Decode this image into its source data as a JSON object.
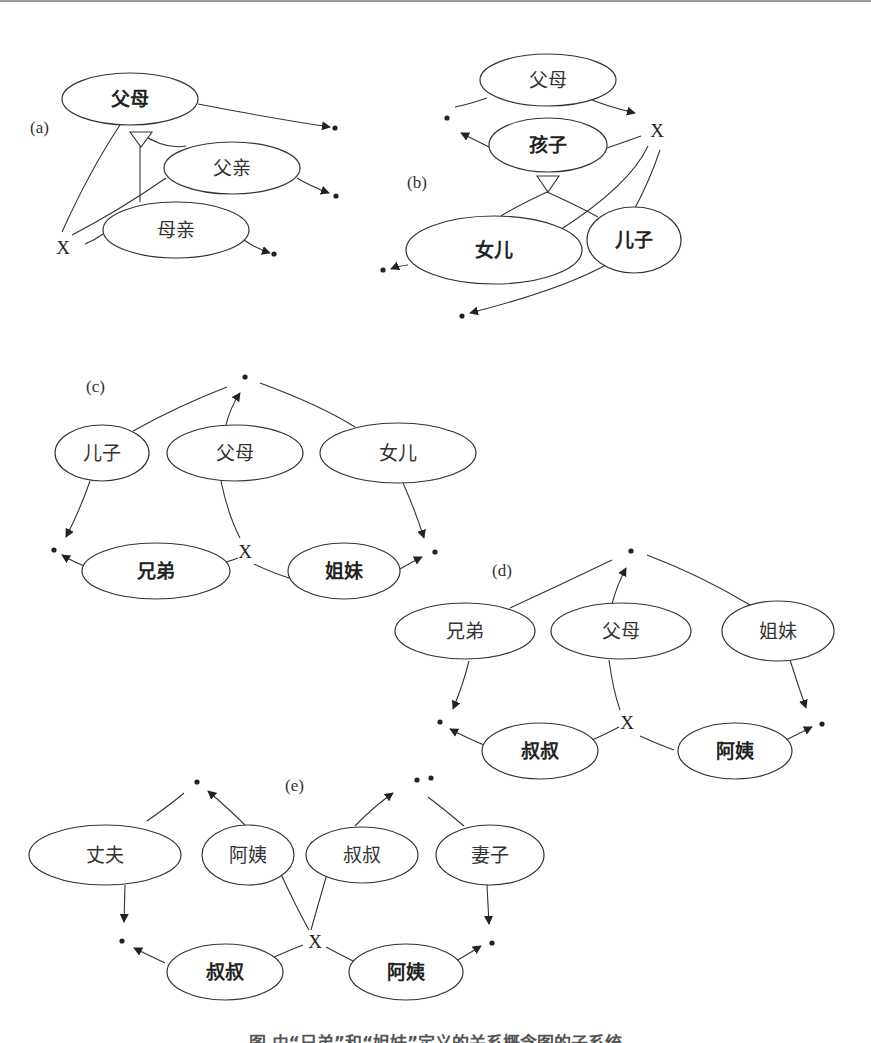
{
  "figure": {
    "caption": "图 由“兄弟”和“姐妹”定义的关系概念图的子系统",
    "colors": {
      "stroke": "#333333",
      "fill": "#ffffff",
      "text": "#333333"
    },
    "panels": [
      {
        "id": "a",
        "label": "(a)",
        "label_pos": [
          30,
          133
        ]
      },
      {
        "id": "b",
        "label": "(b)",
        "label_pos": [
          407,
          188
        ]
      },
      {
        "id": "c",
        "label": "(c)",
        "label_pos": [
          86,
          392
        ]
      },
      {
        "id": "d",
        "label": "(d)",
        "label_pos": [
          492,
          576
        ]
      },
      {
        "id": "e",
        "label": "(e)",
        "label_pos": [
          285,
          791
        ]
      }
    ],
    "nodes": [
      {
        "id": "a_parents",
        "label": "父母",
        "cx": 130,
        "cy": 99,
        "rx": 68,
        "ry": 26,
        "bold": true
      },
      {
        "id": "a_father",
        "label": "父亲",
        "cx": 232,
        "cy": 168,
        "rx": 68,
        "ry": 26,
        "bold": false
      },
      {
        "id": "a_mother",
        "label": "母亲",
        "cx": 176,
        "cy": 230,
        "rx": 73,
        "ry": 28,
        "bold": false
      },
      {
        "id": "b_parents",
        "label": "父母",
        "cx": 548,
        "cy": 80,
        "rx": 68,
        "ry": 26,
        "bold": false
      },
      {
        "id": "b_child",
        "label": "孩子",
        "cx": 548,
        "cy": 145,
        "rx": 59,
        "ry": 27,
        "bold": true
      },
      {
        "id": "b_daughter",
        "label": "女儿",
        "cx": 494,
        "cy": 250,
        "rx": 88,
        "ry": 34,
        "bold": true
      },
      {
        "id": "b_son",
        "label": "儿子",
        "cx": 634,
        "cy": 240,
        "rx": 47,
        "ry": 33,
        "bold": true
      },
      {
        "id": "c_son",
        "label": "儿子",
        "cx": 102,
        "cy": 453,
        "rx": 47,
        "ry": 28,
        "bold": false
      },
      {
        "id": "c_parents",
        "label": "父母",
        "cx": 235,
        "cy": 453,
        "rx": 68,
        "ry": 28,
        "bold": false
      },
      {
        "id": "c_daughter",
        "label": "女儿",
        "cx": 398,
        "cy": 453,
        "rx": 78,
        "ry": 30,
        "bold": false
      },
      {
        "id": "c_brother",
        "label": "兄弟",
        "cx": 156,
        "cy": 571,
        "rx": 74,
        "ry": 28,
        "bold": true
      },
      {
        "id": "c_sister",
        "label": "姐妹",
        "cx": 344,
        "cy": 571,
        "rx": 56,
        "ry": 28,
        "bold": true
      },
      {
        "id": "d_brother",
        "label": "兄弟",
        "cx": 465,
        "cy": 631,
        "rx": 70,
        "ry": 28,
        "bold": false
      },
      {
        "id": "d_parents",
        "label": "父母",
        "cx": 621,
        "cy": 631,
        "rx": 70,
        "ry": 28,
        "bold": false
      },
      {
        "id": "d_sister",
        "label": "姐妹",
        "cx": 778,
        "cy": 631,
        "rx": 56,
        "ry": 30,
        "bold": false
      },
      {
        "id": "d_uncle",
        "label": "叔叔",
        "cx": 540,
        "cy": 751,
        "rx": 58,
        "ry": 28,
        "bold": true
      },
      {
        "id": "d_aunt",
        "label": "阿姨",
        "cx": 735,
        "cy": 751,
        "rx": 57,
        "ry": 28,
        "bold": true
      },
      {
        "id": "e_husband",
        "label": "丈夫",
        "cx": 105,
        "cy": 855,
        "rx": 76,
        "ry": 30,
        "bold": false
      },
      {
        "id": "e_aunt_top",
        "label": "阿姨",
        "cx": 248,
        "cy": 855,
        "rx": 46,
        "ry": 30,
        "bold": false
      },
      {
        "id": "e_uncle_top",
        "label": "叔叔",
        "cx": 362,
        "cy": 855,
        "rx": 56,
        "ry": 28,
        "bold": false
      },
      {
        "id": "e_wife",
        "label": "妻子",
        "cx": 490,
        "cy": 855,
        "rx": 54,
        "ry": 30,
        "bold": false
      },
      {
        "id": "e_uncle",
        "label": "叔叔",
        "cx": 225,
        "cy": 972,
        "rx": 58,
        "ry": 28,
        "bold": true
      },
      {
        "id": "e_aunt",
        "label": "阿姨",
        "cx": 406,
        "cy": 972,
        "rx": 57,
        "ry": 28,
        "bold": true
      }
    ],
    "x_markers": [
      {
        "panel": "a",
        "label": "X",
        "x": 63,
        "y": 247
      },
      {
        "panel": "b",
        "label": "X",
        "x": 657,
        "y": 130
      },
      {
        "panel": "c",
        "label": "X",
        "x": 245,
        "y": 551
      },
      {
        "panel": "d",
        "label": "X",
        "x": 627,
        "y": 722
      },
      {
        "panel": "e",
        "label": "X",
        "x": 315,
        "y": 941
      }
    ],
    "dots": [
      {
        "x": 335,
        "y": 128
      },
      {
        "x": 336,
        "y": 196
      },
      {
        "x": 274,
        "y": 254
      },
      {
        "x": 447,
        "y": 118
      },
      {
        "x": 383,
        "y": 270
      },
      {
        "x": 462,
        "y": 316
      },
      {
        "x": 245,
        "y": 377
      },
      {
        "x": 54,
        "y": 550
      },
      {
        "x": 435,
        "y": 552
      },
      {
        "x": 631,
        "y": 551
      },
      {
        "x": 440,
        "y": 722
      },
      {
        "x": 822,
        "y": 724
      },
      {
        "x": 431,
        "y": 778
      },
      {
        "x": 197,
        "y": 782
      },
      {
        "x": 417,
        "y": 780
      },
      {
        "x": 122,
        "y": 941
      },
      {
        "x": 492,
        "y": 943
      }
    ],
    "edges": [
      {
        "d": "M198,104 Q270,118 330,127",
        "arrow": true
      },
      {
        "d": "M297,178 Q310,186 329,193",
        "arrow": true
      },
      {
        "d": "M244,240 Q255,248 270,253",
        "arrow": true
      },
      {
        "d": "M120,125 Q90,170 62,232",
        "arrow": false
      },
      {
        "d": "M72,235 Q120,210 166,178",
        "arrow": false
      },
      {
        "d": "M85,244 Q95,240 103,234",
        "arrow": false
      },
      {
        "d": "M140,133 L140,202",
        "arrow": false
      },
      {
        "d": "M140,133 Q165,150 186,146",
        "arrow": false
      },
      {
        "d": "M585,97 Q605,106 635,113",
        "arrow": true
      },
      {
        "d": "M487,98 Q470,104 455,107",
        "arrow": false
      },
      {
        "d": "M491,148 Q475,140 461,133",
        "arrow": true
      },
      {
        "d": "M607,148 Q630,140 641,136",
        "arrow": false
      },
      {
        "d": "M547,192 Q515,207 501,216",
        "arrow": false
      },
      {
        "d": "M547,192 Q580,207 598,217",
        "arrow": false
      },
      {
        "d": "M648,146 Q630,185 560,230",
        "arrow": false
      },
      {
        "d": "M660,150 Q650,180 634,210",
        "arrow": false
      },
      {
        "d": "M408,265 Q398,266 391,269",
        "arrow": true
      },
      {
        "d": "M606,265 Q560,290 470,313",
        "arrow": true
      },
      {
        "d": "M133,431 Q180,405 227,387",
        "arrow": false
      },
      {
        "d": "M260,383 Q320,405 355,427",
        "arrow": false
      },
      {
        "d": "M226,425 Q230,408 240,393",
        "arrow": true
      },
      {
        "d": "M90,481 Q80,510 66,537",
        "arrow": true
      },
      {
        "d": "M403,483 Q415,510 424,538",
        "arrow": true
      },
      {
        "d": "M221,481 Q228,515 240,538",
        "arrow": false
      },
      {
        "d": "M90,568 Q75,563 62,555",
        "arrow": true
      },
      {
        "d": "M226,562 Q233,560 238,558",
        "arrow": false
      },
      {
        "d": "M254,564 Q270,572 289,578",
        "arrow": false
      },
      {
        "d": "M400,569 Q412,562 422,557",
        "arrow": true
      },
      {
        "d": "M510,608 Q560,585 612,560",
        "arrow": false
      },
      {
        "d": "M647,555 Q700,575 750,605",
        "arrow": false
      },
      {
        "d": "M612,604 Q617,585 626,568",
        "arrow": true
      },
      {
        "d": "M469,661 Q463,685 453,709",
        "arrow": true
      },
      {
        "d": "M790,660 Q798,685 806,708",
        "arrow": true
      },
      {
        "d": "M609,660 Q613,690 620,710",
        "arrow": false
      },
      {
        "d": "M484,745 Q465,737 450,729",
        "arrow": true
      },
      {
        "d": "M592,740 Q608,733 619,727",
        "arrow": false
      },
      {
        "d": "M640,736 Q660,745 674,750",
        "arrow": false
      },
      {
        "d": "M786,740 Q800,733 812,727",
        "arrow": true
      },
      {
        "d": "M147,821 Q170,805 184,793",
        "arrow": false
      },
      {
        "d": "M245,825 Q230,810 208,791",
        "arrow": true
      },
      {
        "d": "M355,826 Q372,808 393,793",
        "arrow": true
      },
      {
        "d": "M428,797 Q445,810 464,826",
        "arrow": false
      },
      {
        "d": "M125,885 L124,922",
        "arrow": true
      },
      {
        "d": "M487,885 L489,924",
        "arrow": true
      },
      {
        "d": "M280,872 Q295,905 309,930",
        "arrow": false
      },
      {
        "d": "M327,874 Q318,905 311,930",
        "arrow": false
      },
      {
        "d": "M165,963 Q148,955 134,948",
        "arrow": true
      },
      {
        "d": "M272,958 Q290,950 303,945",
        "arrow": false
      },
      {
        "d": "M326,947 Q345,957 357,963",
        "arrow": false
      },
      {
        "d": "M456,961 Q470,953 481,946",
        "arrow": true
      }
    ],
    "inheritance_triangles": [
      {
        "panel": "a",
        "points": "130,132 152,132 141,147"
      },
      {
        "panel": "b",
        "points": "537,176 559,176 548,192"
      }
    ]
  }
}
